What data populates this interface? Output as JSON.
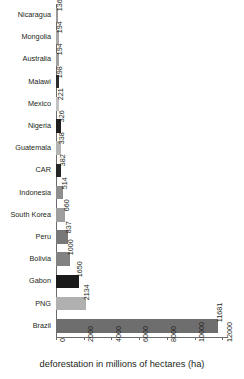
{
  "chart_data": {
    "type": "bar",
    "orientation": "horizontal",
    "title": "",
    "xlabel": "deforestation in millions of hectares (ha)",
    "ylabel": "",
    "xlim": [
      0,
      12400
    ],
    "xticks": [
      0,
      2000,
      4000,
      6000,
      8000,
      10000,
      12000
    ],
    "xticklabels": [
      "0",
      "2000",
      "4000",
      "6000",
      "8000",
      "10000",
      "12000"
    ],
    "grid": false,
    "legend": "none",
    "value_labels_rotated": true,
    "categories": [
      "Nicaragua",
      "Mongolia",
      "Australia",
      "Malawi",
      "Mexico",
      "Nigeria",
      "Guatemala",
      "CAR",
      "Indonesia",
      "South Korea",
      "Peru",
      "Bolivia",
      "Gabon",
      "PNG",
      "Brazil"
    ],
    "values": [
      136,
      194,
      194,
      198,
      221,
      326,
      338,
      382,
      514,
      660,
      837,
      1000,
      1650,
      2134,
      11681
    ],
    "bar_colors": [
      "#9a9a9a",
      "#a8a8a8",
      "#a0a0a0",
      "#2b2b2b",
      "#c2c2c2",
      "#1f1f1f",
      "#b4b4b4",
      "#262626",
      "#8e8e8e",
      "#9e9e9e",
      "#787878",
      "#828282",
      "#1a1a1a",
      "#b0b0b0",
      "#6e6e6e"
    ],
    "points": [
      {
        "category": "Nicaragua",
        "value": 136,
        "label": "136",
        "color": "#9a9a9a"
      },
      {
        "category": "Mongolia",
        "value": 194,
        "label": "194",
        "color": "#a8a8a8"
      },
      {
        "category": "Australia",
        "value": 194,
        "label": "194",
        "color": "#a0a0a0"
      },
      {
        "category": "Malawi",
        "value": 198,
        "label": "198",
        "color": "#2b2b2b"
      },
      {
        "category": "Mexico",
        "value": 221,
        "label": "221",
        "color": "#c2c2c2"
      },
      {
        "category": "Nigeria",
        "value": 326,
        "label": "326",
        "color": "#1f1f1f"
      },
      {
        "category": "Guatemala",
        "value": 338,
        "label": "338",
        "color": "#b4b4b4"
      },
      {
        "category": "CAR",
        "value": 382,
        "label": "382",
        "color": "#262626"
      },
      {
        "category": "Indonesia",
        "value": 514,
        "label": "514",
        "color": "#8e8e8e"
      },
      {
        "category": "South Korea",
        "value": 660,
        "label": "660",
        "color": "#9e9e9e"
      },
      {
        "category": "Peru",
        "value": 837,
        "label": "837",
        "color": "#787878"
      },
      {
        "category": "Bolivia",
        "value": 1000,
        "label": "1000",
        "color": "#828282"
      },
      {
        "category": "Gabon",
        "value": 1650,
        "label": "1650",
        "color": "#1a1a1a"
      },
      {
        "category": "PNG",
        "value": 2134,
        "label": "2134",
        "color": "#b0b0b0"
      },
      {
        "category": "Brazil",
        "value": 11681,
        "label": "11681",
        "color": "#6e6e6e"
      }
    ]
  },
  "axis": {
    "x_title": "deforestation in millions of hectares (ha)"
  },
  "colors": {
    "axis": "#6b6b6b",
    "text": "#231f20",
    "background": "#ffffff"
  }
}
